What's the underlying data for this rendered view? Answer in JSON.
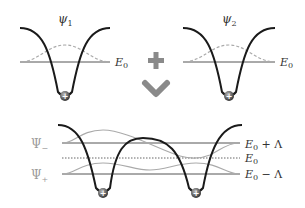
{
  "top_left": {
    "label": "ψ",
    "subscript": "1",
    "energy_label": "E",
    "energy_subscript": "0"
  },
  "top_right": {
    "label": "ψ",
    "subscript": "2",
    "energy_label": "E",
    "energy_subscript": "0"
  },
  "operators": {
    "plus": "+",
    "arrow": "down-chevron"
  },
  "bottom": {
    "state_minus": {
      "label": "Ψ",
      "subscript": "−"
    },
    "state_plus": {
      "label": "Ψ",
      "subscript": "+"
    },
    "level_upper": {
      "label": "E",
      "subscript": "0",
      "suffix": " + Λ"
    },
    "level_middle": {
      "label": "E",
      "subscript": "0"
    },
    "level_lower": {
      "label": "E",
      "subscript": "0",
      "suffix": " − Λ"
    }
  },
  "nucleus_symbol": "+",
  "colors": {
    "potential": "#1a1a1a",
    "level": "#555555",
    "wavefunction": "#aaaaaa",
    "operator": "#8a8a8a",
    "label_gray": "#9a9a9a"
  }
}
